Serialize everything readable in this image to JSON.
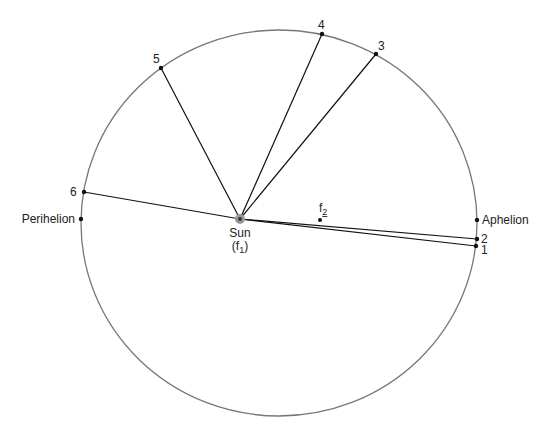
{
  "diagram": {
    "orbit": {
      "cx": 279,
      "cy": 223,
      "rx": 198,
      "ry": 193,
      "stroke": "#777777"
    },
    "sun": {
      "x": 240,
      "y": 219,
      "label": "Sun",
      "sublabel": "(f",
      "sub": "1",
      "close": ")"
    },
    "focus2": {
      "x": 320,
      "y": 220,
      "label": "f",
      "sub": "2"
    },
    "perihelion": {
      "x": 81,
      "y": 219,
      "label": "Perihelion"
    },
    "aphelion": {
      "x": 477,
      "y": 220,
      "label": "Aphelion"
    },
    "points": [
      {
        "id": "1",
        "x": 476,
        "y": 246,
        "lx": 481,
        "ly": 254
      },
      {
        "id": "2",
        "x": 477,
        "y": 239,
        "lx": 481,
        "ly": 243
      },
      {
        "id": "3",
        "x": 376,
        "y": 54,
        "lx": 378,
        "ly": 50
      },
      {
        "id": "4",
        "x": 322,
        "y": 34,
        "lx": 318,
        "ly": 29
      },
      {
        "id": "5",
        "x": 161,
        "y": 68,
        "lx": 153,
        "ly": 63
      },
      {
        "id": "6",
        "x": 84,
        "y": 192,
        "lx": 70,
        "ly": 196
      }
    ]
  }
}
